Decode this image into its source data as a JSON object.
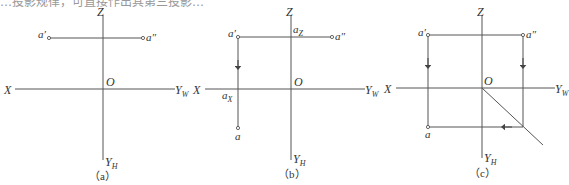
{
  "top_text_cut": "…投影规律，可直接作出其第三投影…",
  "style": {
    "line_color": "#555555",
    "text_color": "#333333"
  },
  "panels": [
    {
      "id": "a",
      "caption": "（a）",
      "axes": {
        "x": "X",
        "z": "Z",
        "yw": "Y",
        "yw_sub": "W",
        "yh": "Y",
        "yh_sub": "H",
        "origin": "O"
      },
      "points": {
        "a_prime": "a′",
        "a_double": "a″"
      }
    },
    {
      "id": "b",
      "caption": "（b）",
      "axes": {
        "x": "X",
        "z": "Z",
        "yw": "Y",
        "yw_sub": "W",
        "yh": "Y",
        "yh_sub": "H",
        "origin": "O"
      },
      "points": {
        "a_prime": "a′",
        "a_double": "a″",
        "a": "a",
        "ax": "a",
        "ax_sub": "X",
        "az": "a",
        "az_sub": "Z"
      }
    },
    {
      "id": "c",
      "caption": "（c）",
      "axes": {
        "x": "X",
        "z": "Z",
        "yw": "Y",
        "yw_sub": "W",
        "yh": "Y",
        "yh_sub": "H",
        "origin": "O"
      },
      "points": {
        "a_prime": "a′",
        "a_double": "a″",
        "a": "a"
      }
    }
  ]
}
